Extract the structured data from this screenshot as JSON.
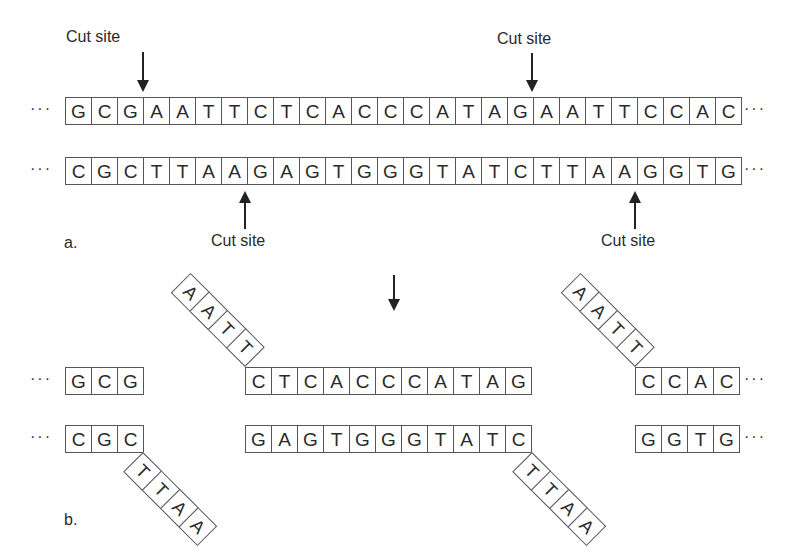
{
  "part_a": {
    "label": "a.",
    "top_strand": [
      "G",
      "C",
      "G",
      "A",
      "A",
      "T",
      "T",
      "C",
      "T",
      "C",
      "A",
      "C",
      "C",
      "C",
      "A",
      "T",
      "A",
      "G",
      "A",
      "A",
      "T",
      "T",
      "C",
      "C",
      "A",
      "C"
    ],
    "bottom_strand": [
      "C",
      "G",
      "C",
      "T",
      "T",
      "A",
      "A",
      "G",
      "A",
      "G",
      "T",
      "G",
      "G",
      "G",
      "T",
      "A",
      "T",
      "C",
      "T",
      "T",
      "A",
      "A",
      "G",
      "G",
      "T",
      "G"
    ],
    "ellipsis": "···",
    "cut_sites": [
      {
        "label": "Cut site",
        "strand": "top",
        "after_index": 3
      },
      {
        "label": "Cut site",
        "strand": "top",
        "after_index": 18
      },
      {
        "label": "Cut site",
        "strand": "bottom",
        "after_index": 7
      },
      {
        "label": "Cut site",
        "strand": "bottom",
        "after_index": 22
      }
    ]
  },
  "part_b": {
    "label": "b.",
    "ellipsis": "···",
    "fragments": {
      "left_top": [
        "G",
        "C",
        "G"
      ],
      "left_bottom": [
        "C",
        "G",
        "C"
      ],
      "left_bottom_overhang": [
        "T",
        "T",
        "A",
        "A"
      ],
      "middle_top_overhang": [
        "A",
        "A",
        "T",
        "T"
      ],
      "middle_top": [
        "C",
        "T",
        "C",
        "A",
        "C",
        "C",
        "C",
        "A",
        "T",
        "A",
        "G"
      ],
      "middle_bottom": [
        "G",
        "A",
        "G",
        "T",
        "G",
        "G",
        "G",
        "T",
        "A",
        "T",
        "C"
      ],
      "middle_bottom_overhang": [
        "T",
        "T",
        "A",
        "A"
      ],
      "right_top_overhang": [
        "A",
        "A",
        "T",
        "T"
      ],
      "right_top": [
        "C",
        "C",
        "A",
        "C"
      ],
      "right_bottom": [
        "G",
        "G",
        "T",
        "G"
      ]
    }
  }
}
